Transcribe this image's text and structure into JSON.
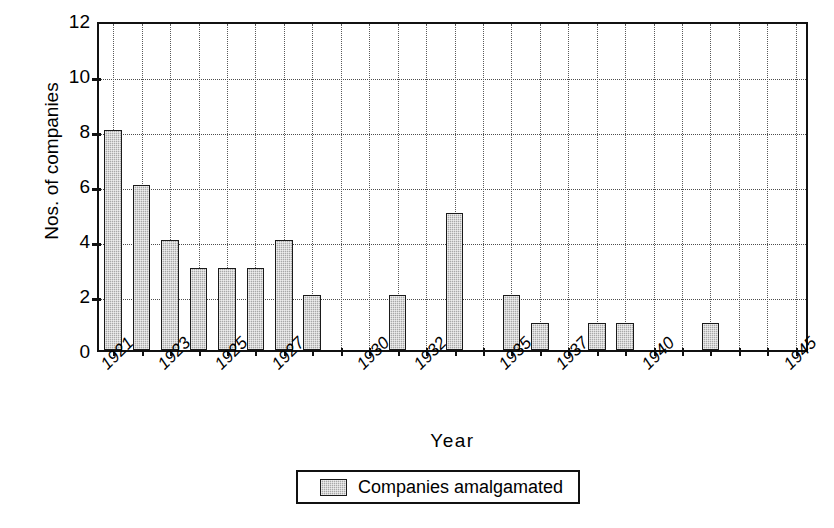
{
  "chart_data": {
    "type": "bar",
    "title": "",
    "xlabel": "Year",
    "ylabel": "Nos. of companies",
    "ylim": [
      0,
      12
    ],
    "ytick_values": [
      0,
      2,
      4,
      6,
      8,
      10,
      12
    ],
    "ytick_labels": [
      "0",
      "2",
      "4",
      "6",
      "8",
      "10",
      "12"
    ],
    "grid": "both-dotted",
    "legend_position": "below-plot-center",
    "series": [
      {
        "name": "Companies amalgamated",
        "color": "#a8a8a8",
        "values": [
          8,
          6,
          4,
          3,
          3,
          3,
          4,
          2,
          0,
          0,
          2,
          0,
          5,
          0,
          2,
          1,
          0,
          1,
          1,
          0,
          0,
          1,
          0,
          0,
          0
        ]
      }
    ],
    "categories": [
      "1921",
      "1922",
      "1923",
      "1924",
      "1925",
      "1926",
      "1927",
      "1928",
      "1929",
      "1930",
      "1931",
      "1932",
      "1933",
      "1934",
      "1935",
      "1936",
      "1937",
      "1938",
      "1939",
      "1940",
      "1941",
      "1942",
      "1943",
      "1944",
      "1945"
    ],
    "xtick_labels": [
      "1921",
      "1923",
      "1925",
      "1927",
      "1930",
      "1932",
      "1935",
      "1937",
      "1940",
      "1945"
    ],
    "xtick_category_index": [
      0,
      2,
      4,
      6,
      9,
      11,
      14,
      16,
      19,
      24
    ]
  },
  "legend": {
    "entries": [
      {
        "label": "Companies amalgamated",
        "color": "#a8a8a8"
      }
    ]
  },
  "axes": {
    "y_title": "Nos. of companies",
    "x_title": "Year"
  }
}
